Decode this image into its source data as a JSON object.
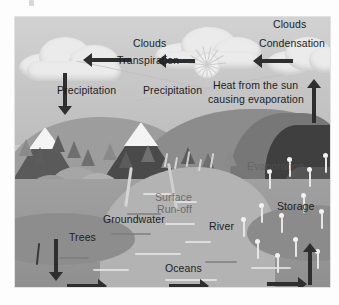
{
  "diagram": {
    "frame": {
      "x": 15,
      "y": 17,
      "width": 315,
      "height": 270
    },
    "palette": {
      "sky": "#c9c9c9",
      "cloud": "#ebebeb",
      "mountain": "#4a4a4a",
      "snow": "#f4f4f4",
      "hill": "#8c8c8c",
      "water": "#a0a0a0",
      "river": "#b3b3b3",
      "arrow": "#2e2e2e",
      "label_text": "#1d1d1d",
      "droplet": "#f2f2f2"
    },
    "labels": [
      {
        "id": "clouds-left",
        "text": "Clouds"
      },
      {
        "id": "clouds-right",
        "text": "Clouds"
      },
      {
        "id": "transpiration",
        "text": "Transpiration"
      },
      {
        "id": "condensation",
        "text": "Condensation"
      },
      {
        "id": "precipitation-1",
        "text": "Precipitation"
      },
      {
        "id": "precipitation-2",
        "text": "Precipitation"
      },
      {
        "id": "heat-from-sun",
        "text": "Heat from the sun causing evaporation"
      },
      {
        "id": "evaporation",
        "text": "Evaporation"
      },
      {
        "id": "storage",
        "text": "Storage"
      },
      {
        "id": "surface-runoff",
        "text": "Surface Run-off"
      },
      {
        "id": "groundwater",
        "text": "Groundwater"
      },
      {
        "id": "trees",
        "text": "Trees"
      },
      {
        "id": "river",
        "text": "River"
      },
      {
        "id": "oceans",
        "text": "Oceans"
      }
    ],
    "label_text": {
      "clouds_left": "Clouds",
      "clouds_right": "Clouds",
      "transpiration": "Transpiration",
      "condensation": "Condensation",
      "precipitation_1": "Precipitation",
      "precipitation_2": "Precipitation",
      "heat_line_1": "Heat from the sun",
      "heat_line_2": "causing evaporation",
      "evaporation": "Evaporation",
      "storage": "Storage",
      "surface_runoff_line_1": "Surface",
      "surface_runoff_line_2": "Run-off",
      "groundwater": "Groundwater",
      "trees": "Trees",
      "river": "River",
      "oceans": "Oceans"
    },
    "arrows": [
      {
        "id": "arrow-transpiration-left",
        "direction": "left",
        "meaning": "vapour moving left toward clouds"
      },
      {
        "id": "arrow-transpiration-mid",
        "direction": "left",
        "meaning": "vapour moving left past the sun"
      },
      {
        "id": "arrow-condensation",
        "direction": "left",
        "meaning": "condensation moving left"
      },
      {
        "id": "arrow-precipitation",
        "direction": "down",
        "meaning": "rain falling from cloud"
      },
      {
        "id": "arrow-evaporation-right",
        "direction": "up",
        "meaning": "evaporation rising at right edge"
      },
      {
        "id": "arrow-storage-up",
        "direction": "up",
        "meaning": "water rising from storage"
      },
      {
        "id": "arrow-infiltration-down",
        "direction": "down",
        "meaning": "water sinking to groundwater"
      },
      {
        "id": "arrow-flow-left",
        "direction": "right",
        "meaning": "ocean flow"
      },
      {
        "id": "arrow-flow-oceans",
        "direction": "right",
        "meaning": "ocean flow"
      },
      {
        "id": "arrow-flow-right",
        "direction": "right",
        "meaning": "ocean flow"
      }
    ],
    "sun": {
      "id": "sun-icon",
      "ray_count": 30
    }
  }
}
